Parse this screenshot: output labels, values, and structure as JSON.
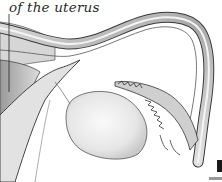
{
  "illustration": {
    "subject": "uterus-fallopian-tube-ovary-anatomy",
    "caption": "of the uterus",
    "style": "pencil-shaded monochrome",
    "colors": {
      "ink": "#2a2a2a",
      "shade": "#b8b8b8",
      "paper": "#ffffff"
    }
  }
}
